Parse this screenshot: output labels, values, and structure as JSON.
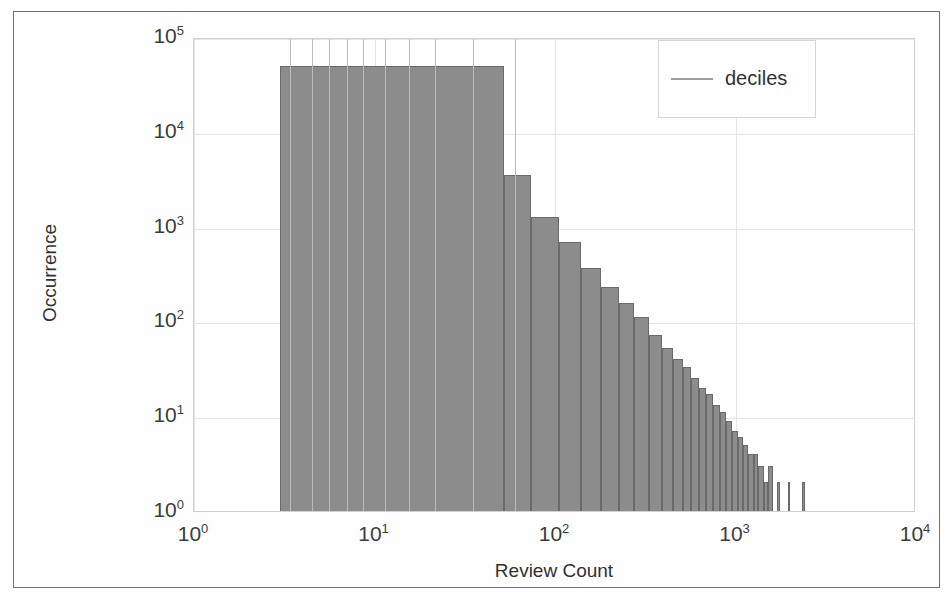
{
  "figure": {
    "legend": {
      "position": "top-right",
      "entries": [
        {
          "label": "deciles",
          "marker": "line",
          "color": "#9a9c9d"
        }
      ]
    }
  },
  "chart_data": {
    "type": "bar",
    "subtype": "histogram-log-log",
    "title": "",
    "xlabel": "Review Count",
    "ylabel": "Occurrence",
    "xscale": "log",
    "yscale": "log",
    "xlim": [
      1,
      10000
    ],
    "ylim": [
      1,
      100000
    ],
    "grid": true,
    "bar_color": "#8c8c8c",
    "xtick_labels": [
      "10",
      "10",
      "10",
      "10",
      "10"
    ],
    "xtick_exponents": [
      "0",
      "1",
      "2",
      "3",
      "4"
    ],
    "xtick_values": [
      1,
      10,
      100,
      1000,
      10000
    ],
    "ytick_labels": [
      "10",
      "10",
      "10",
      "10",
      "10",
      "10"
    ],
    "ytick_exponents": [
      "0",
      "1",
      "2",
      "3",
      "4",
      "5"
    ],
    "ytick_values": [
      1,
      10,
      100,
      1000,
      10000,
      100000
    ],
    "bins": [
      {
        "x_left": 3.0,
        "x_right": 52.0,
        "count": 50000
      },
      {
        "x_left": 52.0,
        "x_right": 74.0,
        "count": 3500
      },
      {
        "x_left": 74.0,
        "x_right": 105.0,
        "count": 1250
      },
      {
        "x_left": 105.0,
        "x_right": 140.0,
        "count": 680
      },
      {
        "x_left": 140.0,
        "x_right": 180.0,
        "count": 370
      },
      {
        "x_left": 180.0,
        "x_right": 225.0,
        "count": 230
      },
      {
        "x_left": 225.0,
        "x_right": 275.0,
        "count": 155
      },
      {
        "x_left": 275.0,
        "x_right": 330.0,
        "count": 110
      },
      {
        "x_left": 330.0,
        "x_right": 390.0,
        "count": 72
      },
      {
        "x_left": 390.0,
        "x_right": 450.0,
        "count": 52
      },
      {
        "x_left": 450.0,
        "x_right": 510.0,
        "count": 40
      },
      {
        "x_left": 510.0,
        "x_right": 570.0,
        "count": 33
      },
      {
        "x_left": 570.0,
        "x_right": 630.0,
        "count": 25
      },
      {
        "x_left": 630.0,
        "x_right": 690.0,
        "count": 20
      },
      {
        "x_left": 690.0,
        "x_right": 750.0,
        "count": 17
      },
      {
        "x_left": 750.0,
        "x_right": 820.0,
        "count": 13
      },
      {
        "x_left": 820.0,
        "x_right": 890.0,
        "count": 11
      },
      {
        "x_left": 890.0,
        "x_right": 960.0,
        "count": 9
      },
      {
        "x_left": 960.0,
        "x_right": 1030.0,
        "count": 7
      },
      {
        "x_left": 1030.0,
        "x_right": 1100.0,
        "count": 6
      },
      {
        "x_left": 1100.0,
        "x_right": 1180.0,
        "count": 5
      },
      {
        "x_left": 1180.0,
        "x_right": 1260.0,
        "count": 4
      },
      {
        "x_left": 1260.0,
        "x_right": 1340.0,
        "count": 4
      },
      {
        "x_left": 1340.0,
        "x_right": 1430.0,
        "count": 3
      },
      {
        "x_left": 1430.0,
        "x_right": 1520.0,
        "count": 2
      },
      {
        "x_left": 1520.0,
        "x_right": 1610.0,
        "count": 3
      },
      {
        "x_left": 1700.0,
        "x_right": 1760.0,
        "count": 2
      },
      {
        "x_left": 1950.0,
        "x_right": 2010.0,
        "count": 2
      },
      {
        "x_left": 2350.0,
        "x_right": 2420.0,
        "count": 2
      }
    ],
    "deciles": [
      3.4,
      4.5,
      5.6,
      7.0,
      8.6,
      11.5,
      15.5,
      21.5,
      35.0,
      60.0
    ]
  }
}
